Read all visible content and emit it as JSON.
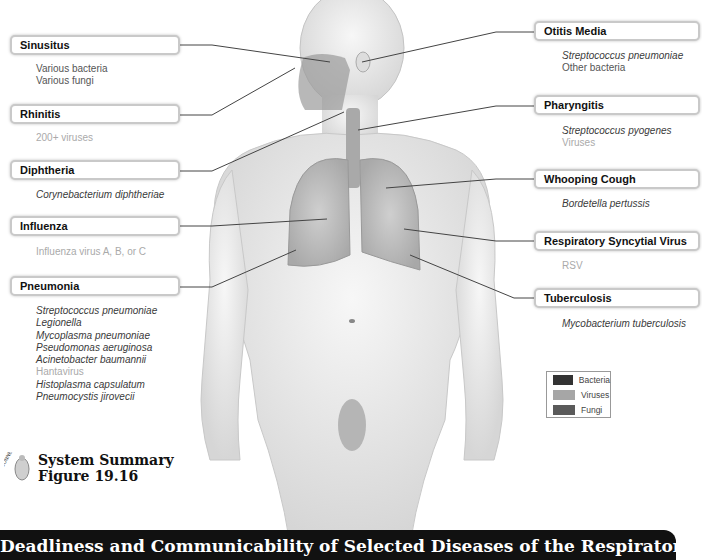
{
  "figure": {
    "summary_title": "System Summary",
    "summary_subtitle": "Figure 19.16",
    "connect_label": "CONNECT",
    "banner_title": "Deadliness and Communicability of Selected Diseases of the Respiratory System"
  },
  "legend": {
    "items": [
      {
        "label": "Bacteria",
        "color": "#333333"
      },
      {
        "label": "Viruses",
        "color": "#a6a6a6"
      },
      {
        "label": "Fungi",
        "color": "#5a5a5a"
      }
    ]
  },
  "diseases_left": [
    {
      "name": "Sinusitus",
      "pathogens": [
        {
          "text": "Various bacteria",
          "type": "bacteria-generic"
        },
        {
          "text": "Various fungi",
          "type": "fungi"
        }
      ]
    },
    {
      "name": "Rhinitis",
      "pathogens": [
        {
          "text": "200+ viruses",
          "type": "virus"
        }
      ]
    },
    {
      "name": "Diphtheria",
      "pathogens": [
        {
          "text": "Corynebacterium diphtheriae",
          "type": "bacteria"
        }
      ]
    },
    {
      "name": "Influenza",
      "pathogens": [
        {
          "text": "Influenza virus A, B, or C",
          "type": "virus"
        }
      ]
    },
    {
      "name": "Pneumonia",
      "pathogens": [
        {
          "text": "Streptococcus pneumoniae",
          "type": "bacteria"
        },
        {
          "text": "Legionella",
          "type": "bacteria"
        },
        {
          "text": "Mycoplasma pneumoniae",
          "type": "bacteria"
        },
        {
          "text": "Pseudomonas aeruginosa",
          "type": "bacteria"
        },
        {
          "text": "Acinetobacter baumannii",
          "type": "bacteria"
        },
        {
          "text": "Hantavirus",
          "type": "virus"
        },
        {
          "text": "Histoplasma capsulatum",
          "type": "fungi"
        },
        {
          "text": "Pneumocystis jirovecii",
          "type": "fungi"
        }
      ]
    }
  ],
  "diseases_right": [
    {
      "name": "Otitis Media",
      "pathogens": [
        {
          "text": "Streptococcus pneumoniae",
          "type": "bacteria"
        },
        {
          "text": "Other bacteria",
          "type": "bacteria-generic"
        }
      ]
    },
    {
      "name": "Pharyngitis",
      "pathogens": [
        {
          "text": "Streptococcus pyogenes",
          "type": "bacteria"
        },
        {
          "text": "Viruses",
          "type": "virus"
        }
      ]
    },
    {
      "name": "Whooping Cough",
      "pathogens": [
        {
          "text": "Bordetella pertussis",
          "type": "bacteria"
        }
      ]
    },
    {
      "name": "Respiratory Syncytial Virus",
      "pathogens": [
        {
          "text": "RSV",
          "type": "virus"
        }
      ]
    },
    {
      "name": "Tuberculosis",
      "pathogens": [
        {
          "text": "Mycobacterium tuberculosis",
          "type": "bacteria"
        }
      ]
    }
  ]
}
